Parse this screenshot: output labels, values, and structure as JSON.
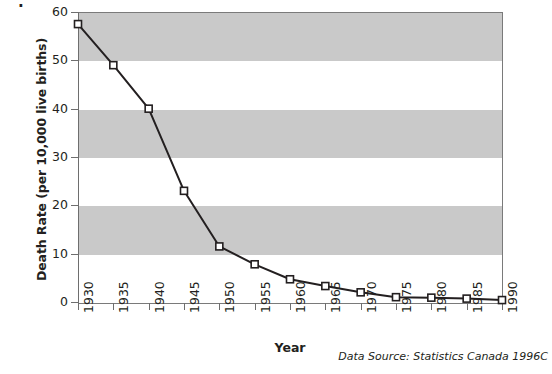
{
  "chart_data": {
    "type": "line",
    "title": "",
    "xlabel": "Year",
    "ylabel": "Death Rate (per 10,000 live births)",
    "source": "Data Source: Statistics Canada 1996C",
    "x": [
      1930,
      1935,
      1940,
      1945,
      1950,
      1955,
      1960,
      1965,
      1970,
      1975,
      1980,
      1985,
      1990
    ],
    "xtick_labels": [
      "1930",
      "1935",
      "1940",
      "1945",
      "1950",
      "1955",
      "1960",
      "1965",
      "1970",
      "1975",
      "1980",
      "1985",
      "1990"
    ],
    "values": [
      57.5,
      49.0,
      40.0,
      23.0,
      11.5,
      7.8,
      4.7,
      3.3,
      2.0,
      1.0,
      0.9,
      0.7,
      0.4
    ],
    "ytick_labels": [
      "0",
      "10",
      "20",
      "30",
      "40",
      "50",
      "60"
    ],
    "yticks": [
      0,
      10,
      20,
      30,
      40,
      50,
      60
    ],
    "ylim": [
      0,
      60
    ],
    "xlim": [
      1930,
      1990
    ],
    "grid": false,
    "legend": null,
    "marker": "open-square",
    "band_color": "#c9c9c9",
    "line_color": "#231f20",
    "banded_ranges": [
      [
        50,
        60
      ],
      [
        30,
        40
      ],
      [
        10,
        20
      ]
    ]
  },
  "misc": {
    "cropped_glyph": "."
  }
}
